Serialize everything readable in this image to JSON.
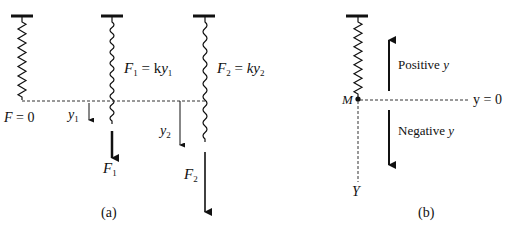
{
  "colors": {
    "ink": "#111111",
    "background": "#ffffff"
  },
  "panel_a": {
    "caption": "(a)",
    "springs": [
      {
        "name": "spring-unloaded",
        "x": 22,
        "top": 16,
        "bottom": 100,
        "coils": 8
      },
      {
        "name": "spring-load-1",
        "x": 112,
        "top": 16,
        "bottom": 124,
        "coils": 9
      },
      {
        "name": "spring-load-2",
        "x": 205,
        "top": 16,
        "bottom": 142,
        "coils": 9
      }
    ],
    "equilibrium_line": {
      "y": 101,
      "x1": 22,
      "x2": 205
    },
    "labels": {
      "f_zero": {
        "var": "F",
        "eq": " = 0"
      },
      "y1": {
        "var": "y",
        "sub": "1"
      },
      "y2": {
        "var": "y",
        "sub": "2"
      },
      "f1_eq": {
        "var": "F",
        "sub": "1",
        "eq": " = k",
        "var2": "y",
        "sub2": "1"
      },
      "f2_eq": {
        "var": "F",
        "sub": "2",
        "eq": " = ",
        "var2": "ky",
        "sub2": "2"
      },
      "f1": {
        "var": "F",
        "sub": "1"
      },
      "f2": {
        "var": "F",
        "sub": "2"
      }
    }
  },
  "panel_b": {
    "caption": "(b)",
    "mass_label": "M",
    "zero_label": "y = 0",
    "positive_label": "Positive",
    "negative_label": "Negative",
    "axis_var": "y",
    "axis_end_label": "Y"
  }
}
